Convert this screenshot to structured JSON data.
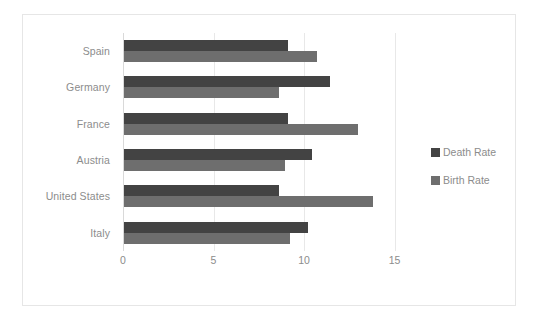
{
  "chart_data": {
    "type": "bar",
    "orientation": "horizontal",
    "title": "",
    "xlabel": "",
    "ylabel": "",
    "categories": [
      "Spain",
      "Germany",
      "France",
      "Austria",
      "United States",
      "Italy"
    ],
    "series": [
      {
        "name": "Death Rate",
        "color": "#434343",
        "values": [
          9.1,
          11.4,
          9.1,
          10.4,
          8.6,
          10.2
        ]
      },
      {
        "name": "Birth Rate",
        "color": "#6e6e6e",
        "values": [
          10.7,
          8.6,
          13.0,
          8.9,
          13.8,
          9.2
        ]
      }
    ],
    "xlim": [
      0,
      16.3
    ],
    "xticks": [
      0,
      5,
      10,
      15
    ],
    "xtick_labels": [
      "0",
      "5",
      "10",
      "15"
    ],
    "grid": true,
    "grid_axis": "x",
    "legend_position": "right",
    "axis_label_color": "#8c8c8c",
    "gridline_color": "#e8e8e8",
    "border_color": "#e6e6e6",
    "background_color": "#ffffff"
  },
  "legend": {
    "items": [
      {
        "label": "Death Rate",
        "swatch": "death"
      },
      {
        "label": "Birth Rate",
        "swatch": "birth"
      }
    ]
  }
}
